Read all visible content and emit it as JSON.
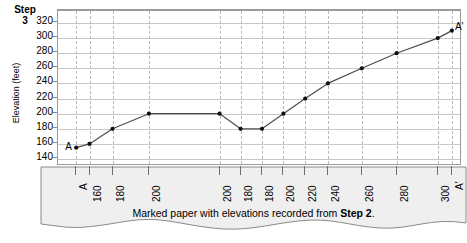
{
  "step": {
    "word": "Step",
    "number": "3"
  },
  "chart_data": {
    "type": "line",
    "title": "",
    "xlabel": "",
    "ylabel": "Elevation (feet)",
    "ylim": [
      140,
      320
    ],
    "ytick_step": 20,
    "yticks": [
      "320",
      "300",
      "280",
      "260",
      "240",
      "220",
      "200",
      "180",
      "160",
      "140"
    ],
    "grid": "horizontal-solid + vertical-dashed",
    "legend": "none",
    "x_tick_labels": [
      "A",
      "160",
      "180",
      "200",
      "200",
      "180",
      "180",
      "200",
      "220",
      "240",
      "260",
      "280",
      "300",
      "A'"
    ],
    "x_positions": [
      0.045,
      0.078,
      0.135,
      0.225,
      0.4,
      0.452,
      0.505,
      0.558,
      0.612,
      0.668,
      0.752,
      0.838,
      0.94,
      0.975
    ],
    "values": [
      155,
      160,
      180,
      200,
      200,
      180,
      180,
      200,
      220,
      240,
      260,
      280,
      300,
      310
    ],
    "point_labels": [
      "A",
      "160",
      "180",
      "200",
      "200",
      "180",
      "180",
      "200",
      "220",
      "240",
      "260",
      "280",
      "300",
      "A'"
    ],
    "endpoint_start_label": "A",
    "endpoint_end_label": "A'",
    "markers": "filled-circle",
    "line_color": "#4d4d4d"
  },
  "paper": {
    "caption_prefix": "Marked paper with elevations recorded from ",
    "caption_bold": "Step 2",
    "caption_suffix": ".",
    "fill_color": "#efefef"
  },
  "colors": {
    "grid": "#c8c8c8",
    "frame": "#9a9a9a",
    "line": "#4d4d4d",
    "marker": "#111111",
    "paper_fill": "#efefef",
    "paper_stroke": "#8a8a8a"
  }
}
